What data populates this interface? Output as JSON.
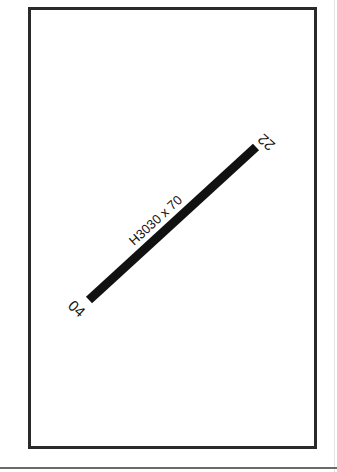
{
  "diagram": {
    "type": "airport-runway-diagram",
    "runway": {
      "designation_low": "04",
      "designation_high": "22",
      "dimensions_label": "H3030 x 70",
      "color": "#111111"
    },
    "frame_color": "#2a2a2a"
  }
}
